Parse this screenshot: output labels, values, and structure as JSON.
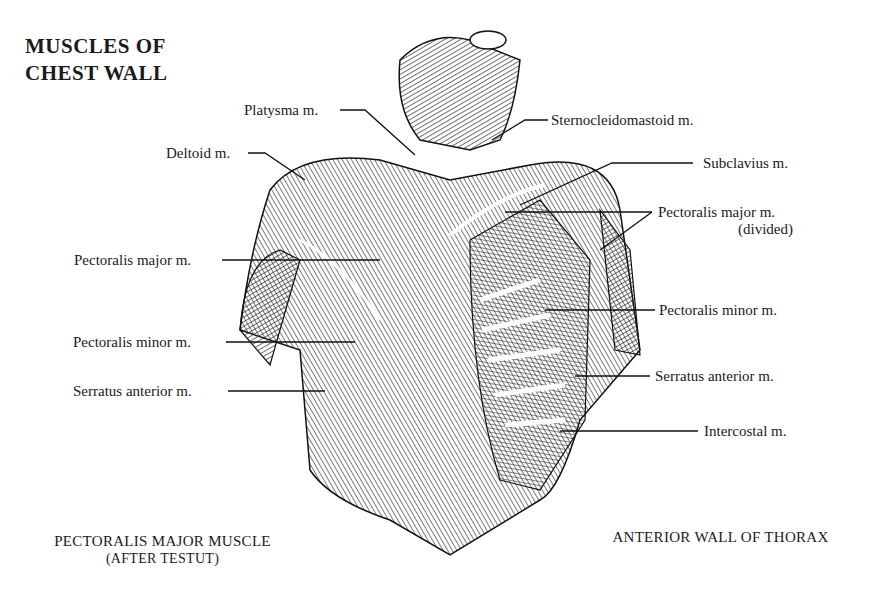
{
  "title": {
    "line1": "MUSCLES OF",
    "line2": "CHEST WALL"
  },
  "labels_left": [
    {
      "text": "Platysma m."
    },
    {
      "text": "Deltoid m."
    },
    {
      "text": "Pectoralis major m."
    },
    {
      "text": "Pectoralis minor m."
    },
    {
      "text": "Serratus anterior m."
    }
  ],
  "labels_right": [
    {
      "text": "Sternocleidomastoid m."
    },
    {
      "text": "Subclavius m."
    },
    {
      "text": "Pectoralis major m.",
      "sub": "(divided)"
    },
    {
      "text": "Pectoralis minor m."
    },
    {
      "text": "Serratus anterior m."
    },
    {
      "text": "Intercostal m."
    }
  ],
  "captions": {
    "left_line1": "PECTORALIS MAJOR MUSCLE",
    "left_line2": "(AFTER TESTUT)",
    "right": "ANTERIOR WALL OF THORAX"
  }
}
